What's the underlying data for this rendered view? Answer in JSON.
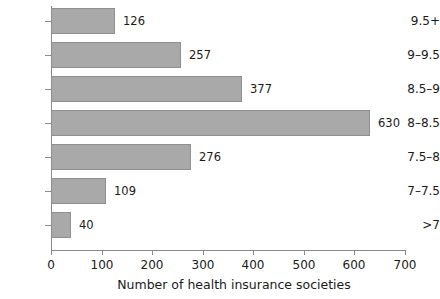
{
  "chart_data": {
    "type": "bar",
    "orientation": "horizontal",
    "title": "",
    "xlabel": "Number of health insurance societies",
    "ylabel": "",
    "categories": [
      "9.5+",
      "9–9.5",
      "8.5–9",
      "8–8.5",
      "7.5–8",
      "7–7.5",
      ">7"
    ],
    "values": [
      126,
      257,
      377,
      630,
      276,
      109,
      40
    ],
    "value_labels": [
      "126",
      "257",
      "377",
      "630",
      "276",
      "109",
      "40"
    ],
    "xlim": [
      0,
      700
    ],
    "xticks": [
      0,
      100,
      200,
      300,
      400,
      500,
      600,
      700
    ],
    "xtick_labels": [
      "0",
      "100",
      "200",
      "300",
      "400",
      "500",
      "600",
      "700"
    ],
    "grid": false,
    "legend": null,
    "bar_color": "#a9a9a9",
    "bar_border_color": "#8f8f8f",
    "axis_color": "#8a8a8a",
    "text_color": "#1a1a1a",
    "background": "#ffffff"
  }
}
